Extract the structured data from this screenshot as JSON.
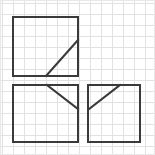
{
  "canvas": {
    "width": 155,
    "height": 155,
    "background_color": "#ffffff",
    "border_color": "#e8e8e8",
    "description": "Geometric line figure drawn on a light graph-paper grid"
  },
  "grid": {
    "visible": true,
    "cell_size": 11,
    "origin_x": 2,
    "origin_y": 3,
    "line_color": "#e2e2e2",
    "line_width": 1,
    "columns": 14,
    "rows": 14
  },
  "stroke": {
    "color": "#3a3a3a",
    "width": 2,
    "linecap": "square"
  },
  "chart_data": {
    "type": "diagram",
    "title": "",
    "shapes": [
      {
        "name": "top-left-square",
        "kind": "rectangle",
        "x": 13,
        "y": 17,
        "width": 65,
        "height": 59,
        "filled": false
      },
      {
        "name": "top-left-diagonal",
        "kind": "line",
        "x1": 46,
        "y1": 76,
        "x2": 78,
        "y2": 40
      },
      {
        "name": "bottom-left-square",
        "kind": "rectangle",
        "x": 13,
        "y": 85,
        "width": 65,
        "height": 57,
        "filled": false
      },
      {
        "name": "bottom-left-diagonal",
        "kind": "line",
        "x1": 47,
        "y1": 85,
        "x2": 78,
        "y2": 109
      },
      {
        "name": "bottom-right-square",
        "kind": "rectangle",
        "x": 88,
        "y": 85,
        "width": 52,
        "height": 57,
        "filled": false
      },
      {
        "name": "bottom-right-diagonal",
        "kind": "line",
        "x1": 89,
        "y1": 109,
        "x2": 120,
        "y2": 85
      }
    ]
  }
}
